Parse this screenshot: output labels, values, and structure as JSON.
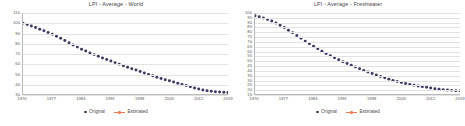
{
  "legend": {
    "original_label": "Original",
    "estimated_label": "Estimated",
    "original_color": "#3b3b63",
    "estimated_color": "#ec7c54"
  },
  "chart_data": [
    {
      "type": "scatter",
      "title": "LPI - Average - World",
      "xlabel": "",
      "ylabel": "",
      "xlim": [
        1970,
        2019
      ],
      "ylim": [
        30,
        110
      ],
      "grid": true,
      "legend_position": "bottom",
      "xticks": [
        1970,
        1977,
        1984,
        1991,
        1998,
        2005,
        2012,
        2019
      ],
      "yticks": [
        30,
        40,
        50,
        60,
        70,
        80,
        90,
        100,
        110
      ],
      "series": [
        {
          "name": "Original",
          "color": "#3b3b63",
          "x": [
            1970,
            1971,
            1972,
            1973,
            1974,
            1975,
            1976,
            1977,
            1978,
            1979,
            1980,
            1981,
            1982,
            1983,
            1984,
            1985,
            1986,
            1987,
            1988,
            1989,
            1990,
            1991,
            1992,
            1993,
            1994,
            1995,
            1996,
            1997,
            1998,
            1999,
            2000,
            2001,
            2002,
            2003,
            2004,
            2005,
            2006,
            2007,
            2008,
            2009,
            2010,
            2011,
            2012,
            2013,
            2014,
            2015,
            2016,
            2017,
            2018,
            2019
          ],
          "values": [
            100.0,
            98.6,
            97.2,
            95.6,
            94.0,
            92.4,
            90.7,
            89.0,
            87.0,
            85.0,
            82.8,
            80.6,
            78.4,
            76.3,
            74.3,
            72.4,
            70.6,
            68.9,
            67.2,
            65.6,
            64.0,
            62.5,
            61.0,
            59.5,
            58.0,
            56.5,
            55.0,
            53.6,
            52.2,
            50.8,
            49.4,
            48.0,
            46.6,
            45.3,
            44.1,
            43.0,
            41.9,
            40.7,
            39.5,
            38.3,
            37.1,
            36.0,
            34.9,
            34.0,
            33.3,
            32.7,
            32.3,
            32.0,
            31.7,
            31.4
          ]
        },
        {
          "name": "Estimated",
          "color": "#ec7c54",
          "x": [],
          "values": []
        }
      ]
    },
    {
      "type": "scatter",
      "title": "LPI - Average - Freshwater",
      "xlabel": "",
      "ylabel": "",
      "xlim": [
        1970,
        2019
      ],
      "ylim": [
        15,
        100
      ],
      "grid": true,
      "legend_position": "bottom",
      "xticks": [
        1970,
        1977,
        1984,
        1991,
        1998,
        2005,
        2012,
        2019
      ],
      "yticks": [
        15,
        20,
        25,
        30,
        35,
        40,
        45,
        50,
        55,
        60,
        65,
        70,
        75,
        80,
        85,
        90,
        95,
        100
      ],
      "series": [
        {
          "name": "Original",
          "color": "#3b3b63",
          "x": [
            1970,
            1971,
            1972,
            1973,
            1974,
            1975,
            1976,
            1977,
            1978,
            1979,
            1980,
            1981,
            1982,
            1983,
            1984,
            1985,
            1986,
            1987,
            1988,
            1989,
            1990,
            1991,
            1992,
            1993,
            1994,
            1995,
            1996,
            1997,
            1998,
            1999,
            2000,
            2001,
            2002,
            2003,
            2004,
            2005,
            2006,
            2007,
            2008,
            2009,
            2010,
            2011,
            2012,
            2013,
            2014,
            2015,
            2016,
            2017,
            2018,
            2019
          ],
          "values": [
            97.0,
            96.0,
            94.8,
            93.3,
            91.5,
            89.5,
            87.2,
            84.7,
            82.0,
            79.2,
            76.3,
            73.4,
            70.5,
            67.7,
            65.0,
            62.4,
            59.9,
            57.5,
            55.2,
            53.0,
            50.9,
            48.9,
            47.0,
            45.1,
            43.3,
            41.5,
            39.8,
            38.1,
            36.5,
            34.9,
            33.4,
            32.0,
            30.6,
            29.3,
            28.1,
            27.0,
            26.0,
            25.1,
            24.3,
            23.5,
            22.7,
            22.0,
            21.3,
            20.6,
            20.0,
            19.5,
            19.1,
            18.8,
            18.5,
            18.3
          ]
        },
        {
          "name": "Estimated",
          "color": "#ec7c54",
          "x": [],
          "values": []
        }
      ]
    }
  ]
}
